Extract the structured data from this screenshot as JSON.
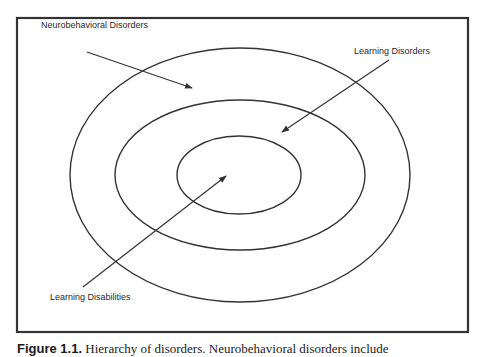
{
  "diagram": {
    "type": "nested-ellipses",
    "frame": {
      "x": 17,
      "y": 18,
      "width": 451,
      "height": 314,
      "stroke": "#333333"
    },
    "ellipses": [
      {
        "name": "neurobehavioral-disorders",
        "cx": 240,
        "cy": 175,
        "rx": 170,
        "ry": 127
      },
      {
        "name": "learning-disorders",
        "cx": 240,
        "cy": 175,
        "rx": 125,
        "ry": 75
      },
      {
        "name": "learning-disabilities",
        "cx": 239,
        "cy": 175,
        "rx": 62,
        "ry": 39
      }
    ],
    "labels": {
      "neurobehavioral": "Neurobehavioral Disorders",
      "learning_disorders": "Learning Disorders",
      "learning_disabilities": "Learning Disabilities"
    },
    "arrows": [
      {
        "from": [
          87,
          52
        ],
        "to": [
          192,
          88
        ],
        "label": "Neurobehavioral Disorders"
      },
      {
        "from": [
          389,
          60
        ],
        "to": [
          282,
          132
        ],
        "label": "Learning Disorders"
      },
      {
        "from": [
          83,
          287
        ],
        "to": [
          226,
          176
        ],
        "label": "Learning Disabilities"
      }
    ]
  },
  "caption": {
    "figure_label": "Figure 1.1.",
    "text": "Hierarchy of disorders. Neurobehavioral disorders include"
  }
}
